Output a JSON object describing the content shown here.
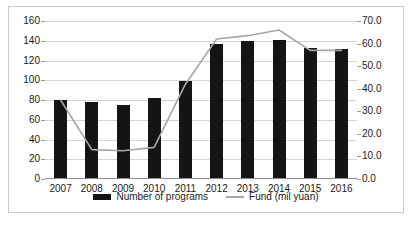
{
  "chart_data": {
    "type": "bar",
    "title": "",
    "subtitle": "",
    "xlabel": "",
    "ylabel": "",
    "categories": [
      "2007",
      "2008",
      "2009",
      "2010",
      "2011",
      "2012",
      "2013",
      "2014",
      "2015",
      "2016"
    ],
    "grid": true,
    "legend_position": "bottom",
    "axes": {
      "left": {
        "label": "",
        "min": 0,
        "max": 160,
        "step": 20,
        "ticks": [
          "0",
          "20",
          "40",
          "60",
          "80",
          "100",
          "120",
          "140",
          "160"
        ]
      },
      "right": {
        "label": "",
        "min": 0,
        "max": 70,
        "step": 10,
        "ticks": [
          "0.0",
          "10.0",
          "20.0",
          "30.0",
          "40.0",
          "50.0",
          "60.0",
          "70.0"
        ]
      }
    },
    "series": [
      {
        "name": "Number of programs",
        "type": "bar",
        "axis": "left",
        "color": "#141414",
        "values": [
          80,
          78,
          75,
          82,
          99,
          137,
          140,
          141,
          133,
          132
        ]
      },
      {
        "name": "Fund (mil yuan)",
        "type": "line",
        "axis": "right",
        "color": "#a6a6a6",
        "values": [
          35.0,
          13.0,
          12.5,
          14.0,
          42.0,
          62.0,
          63.5,
          66.0,
          57.0,
          57.0
        ]
      }
    ]
  },
  "legend": {
    "items": [
      {
        "label": "Number of programs",
        "marker": "bar-swatch"
      },
      {
        "label": "Fund (mil yuan)",
        "marker": "line-swatch"
      }
    ]
  }
}
